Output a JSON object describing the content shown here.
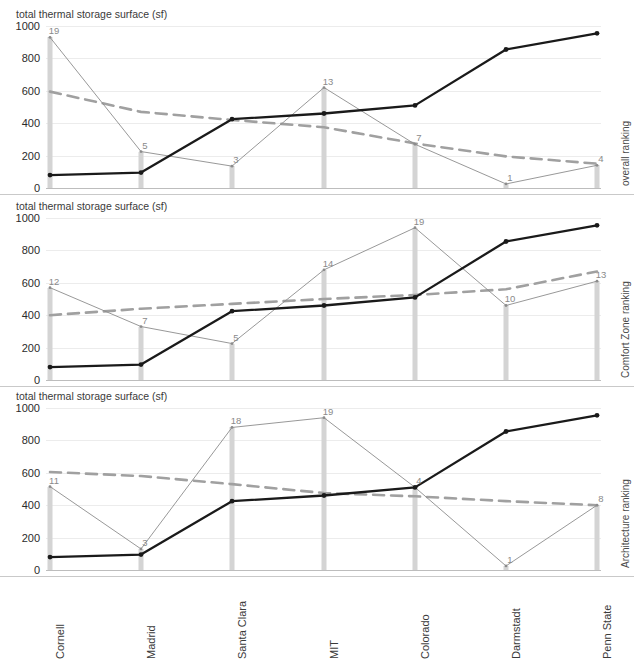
{
  "panels": [
    {
      "axis_title": "total thermal storage surface (sf)",
      "right_label": "overall ranking",
      "rank_labels": [
        "19",
        "5",
        "3",
        "13",
        "7",
        "1",
        "4"
      ]
    },
    {
      "axis_title": "total thermal storage surface (sf)",
      "right_label": "Comfort Zone ranking",
      "rank_labels": [
        "12",
        "7",
        "5",
        "14",
        "19",
        "10",
        "13"
      ]
    },
    {
      "axis_title": "total thermal storage surface (sf)",
      "right_label": "Architecture ranking",
      "rank_labels": [
        "11",
        "3",
        "18",
        "19",
        "4",
        "1",
        "8"
      ]
    }
  ],
  "yticks": [
    "1000",
    "800",
    "600",
    "400",
    "200",
    "0"
  ],
  "chart_data": [
    {
      "type": "line",
      "title": "total thermal storage surface (sf)",
      "xlabel": "",
      "ylabel": "total thermal storage surface (sf)",
      "y2label": "overall ranking",
      "categories": [
        "Cornell",
        "Madrid",
        "Santa Clara",
        "MIT",
        "Colorado",
        "Darmstadt",
        "Penn State"
      ],
      "ylim": [
        0,
        1000
      ],
      "yticks": [
        0,
        200,
        400,
        600,
        800,
        1000
      ],
      "grid": true,
      "legend": "none",
      "series": [
        {
          "name": "total thermal storage surface (sf)",
          "style": "thick-solid-dark",
          "values": [
            80,
            95,
            425,
            460,
            510,
            855,
            955
          ]
        },
        {
          "name": "ranking (bars + thin line)",
          "style": "thin-solid-light",
          "values": [
            930,
            225,
            135,
            620,
            270,
            25,
            140
          ],
          "point_labels": [
            "19",
            "5",
            "3",
            "13",
            "7",
            "1",
            "4"
          ]
        },
        {
          "name": "trend",
          "style": "dashed-gray",
          "values": [
            595,
            470,
            420,
            375,
            275,
            195,
            150
          ]
        }
      ]
    },
    {
      "type": "line",
      "title": "total thermal storage surface (sf)",
      "xlabel": "",
      "ylabel": "total thermal storage surface (sf)",
      "y2label": "Comfort Zone ranking",
      "categories": [
        "Cornell",
        "Madrid",
        "Santa Clara",
        "MIT",
        "Colorado",
        "Darmstadt",
        "Penn State"
      ],
      "ylim": [
        0,
        1000
      ],
      "yticks": [
        0,
        200,
        400,
        600,
        800,
        1000
      ],
      "grid": true,
      "legend": "none",
      "series": [
        {
          "name": "total thermal storage surface (sf)",
          "style": "thick-solid-dark",
          "values": [
            80,
            95,
            425,
            460,
            510,
            855,
            955
          ]
        },
        {
          "name": "ranking (bars + thin line)",
          "style": "thin-solid-light",
          "values": [
            570,
            330,
            225,
            680,
            940,
            460,
            610
          ],
          "point_labels": [
            "12",
            "7",
            "5",
            "14",
            "19",
            "10",
            "13"
          ]
        },
        {
          "name": "trend",
          "style": "dashed-gray",
          "values": [
            400,
            440,
            470,
            500,
            525,
            560,
            670
          ]
        }
      ]
    },
    {
      "type": "line",
      "title": "total thermal storage surface (sf)",
      "xlabel": "",
      "ylabel": "total thermal storage surface (sf)",
      "y2label": "Architecture ranking",
      "categories": [
        "Cornell",
        "Madrid",
        "Santa Clara",
        "MIT",
        "Colorado",
        "Darmstadt",
        "Penn State"
      ],
      "ylim": [
        0,
        1000
      ],
      "yticks": [
        0,
        200,
        400,
        600,
        800,
        1000
      ],
      "grid": true,
      "legend": "none",
      "series": [
        {
          "name": "total thermal storage surface (sf)",
          "style": "thick-solid-dark",
          "values": [
            80,
            95,
            425,
            460,
            510,
            855,
            955
          ]
        },
        {
          "name": "ranking (bars + thin line)",
          "style": "thin-solid-light",
          "values": [
            515,
            130,
            880,
            940,
            510,
            25,
            400
          ],
          "point_labels": [
            "11",
            "3",
            "18",
            "19",
            "4",
            "1",
            "8"
          ]
        },
        {
          "name": "trend",
          "style": "dashed-gray",
          "values": [
            605,
            580,
            530,
            475,
            455,
            425,
            400
          ]
        }
      ]
    }
  ],
  "colors": {
    "thick_line": "#1a1a1a",
    "thin_line": "#8c8c8c",
    "dashed_line": "#a0a0a0",
    "bar": "#d4d4d4",
    "grid": "#ececec",
    "axis": "#bdbdbd",
    "text": "#2b2b2b",
    "label_text": "#8a8a8a"
  }
}
